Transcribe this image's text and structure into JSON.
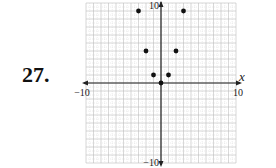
{
  "problem": {
    "number": "27."
  },
  "chart_data": {
    "type": "scatter",
    "title": "",
    "xlabel": "x",
    "ylabel": "",
    "xlim": [
      -10,
      10
    ],
    "ylim": [
      -10,
      10
    ],
    "grid": true,
    "tick_labels": {
      "x_min": "−10",
      "x_max": "10",
      "y_min": "−10",
      "y_max": "10"
    },
    "points": [
      {
        "x": -3,
        "y": 9
      },
      {
        "x": -2,
        "y": 4
      },
      {
        "x": -1,
        "y": 1
      },
      {
        "x": 0,
        "y": 0
      },
      {
        "x": 1,
        "y": 1
      },
      {
        "x": 2,
        "y": 4
      },
      {
        "x": 3,
        "y": 9
      }
    ]
  }
}
